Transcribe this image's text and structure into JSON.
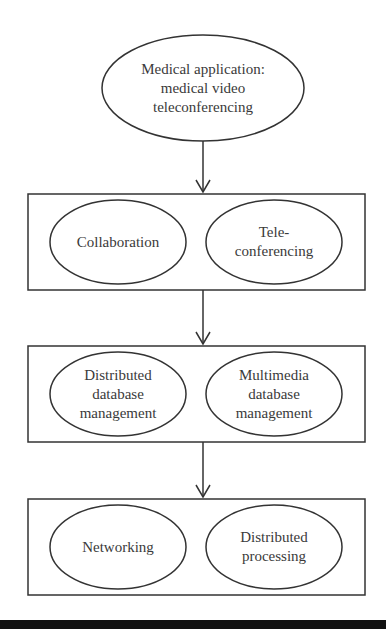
{
  "diagram": {
    "top_node": {
      "label": "Medical application:\nmedical video\nteleconferencing"
    },
    "layers": [
      {
        "nodes": [
          {
            "label": "Collaboration"
          },
          {
            "label": "Tele-\nconferencing"
          }
        ]
      },
      {
        "nodes": [
          {
            "label": "Distributed\ndatabase\nmanagement"
          },
          {
            "label": "Multimedia\ndatabase\nmanagement"
          }
        ]
      },
      {
        "nodes": [
          {
            "label": "Networking"
          },
          {
            "label": "Distributed\nprocessing"
          }
        ]
      }
    ],
    "edges": [
      {
        "from": "top_node",
        "to": "layers.0"
      },
      {
        "from": "layers.0",
        "to": "layers.1"
      },
      {
        "from": "layers.1",
        "to": "layers.2"
      }
    ],
    "colors": {
      "stroke": "#333333",
      "text": "#3a3a3a",
      "background": "#ffffff",
      "footer_bar": "#111111"
    }
  }
}
